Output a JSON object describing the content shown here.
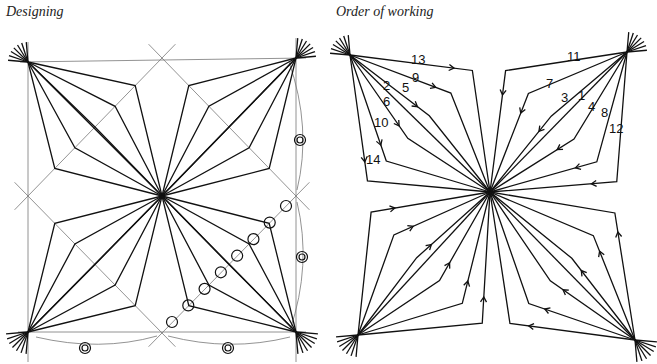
{
  "captions": {
    "left": "Designing",
    "right": "Order of working"
  },
  "left_panel": {
    "corners": {
      "tl": [
        28,
        62
      ],
      "tr": [
        296,
        58
      ],
      "bl": [
        28,
        332
      ],
      "br": [
        296,
        332
      ]
    },
    "center": [
      162,
      196
    ],
    "edge_midpoints": {
      "top": [
        162,
        58
      ],
      "left": [
        28,
        196
      ],
      "right": [
        296,
        196
      ],
      "bottom": [
        162,
        333
      ]
    },
    "paths_per_quadrant": 5,
    "bend_fractions": [
      0.2,
      0.35,
      0.5,
      0.65,
      0.8
    ],
    "divider_circles": {
      "count": 8,
      "start": [
        172,
        322
      ],
      "end": [
        286,
        206
      ],
      "radius": 5.5
    },
    "double_circles": [
      {
        "position": [
          300,
          140
        ],
        "label": "double-circle"
      },
      {
        "position": [
          302,
          257
        ],
        "label": "double-circle"
      },
      {
        "position": [
          85,
          348
        ],
        "label": "double-circle"
      },
      {
        "position": [
          228,
          348
        ],
        "label": "double-circle"
      }
    ]
  },
  "right_panel": {
    "corners": {
      "tl": [
        350,
        55
      ],
      "tr": [
        627,
        52
      ],
      "bl": [
        358,
        335
      ],
      "br": [
        635,
        340
      ]
    },
    "center": [
      490,
      192
    ],
    "order_labels": [
      {
        "text": "1",
        "x": 578,
        "y": 100
      },
      {
        "text": "2",
        "x": 383,
        "y": 90
      },
      {
        "text": "3",
        "x": 561,
        "y": 102
      },
      {
        "text": "4",
        "x": 588,
        "y": 111
      },
      {
        "text": "5",
        "x": 402,
        "y": 92
      },
      {
        "text": "6",
        "x": 383,
        "y": 106
      },
      {
        "text": "7",
        "x": 546,
        "y": 88
      },
      {
        "text": "8",
        "x": 601,
        "y": 117
      },
      {
        "text": "9",
        "x": 412,
        "y": 82
      },
      {
        "text": "10",
        "x": 374,
        "y": 127
      },
      {
        "text": "11",
        "x": 567,
        "y": 61
      },
      {
        "text": "12",
        "x": 609,
        "y": 133
      },
      {
        "text": "13",
        "x": 411,
        "y": 64
      },
      {
        "text": "14",
        "x": 366,
        "y": 164
      }
    ]
  }
}
